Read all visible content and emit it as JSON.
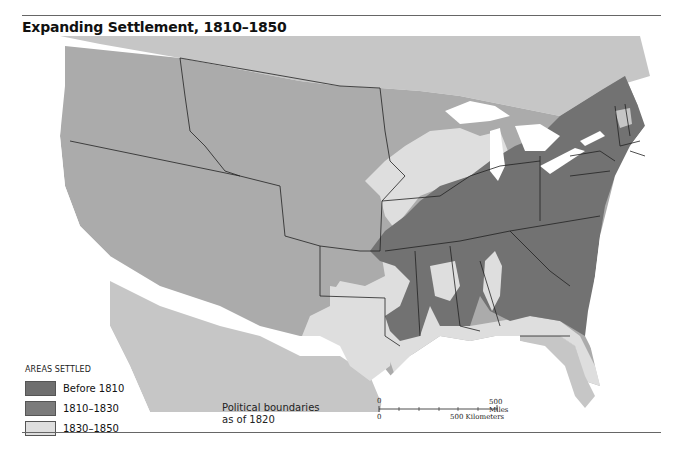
{
  "title": "Expanding Settlement, 1810–1850",
  "legend": {
    "heading": "AREAS SETTLED",
    "items": [
      {
        "label": "Before 1810",
        "color": "#6f6f6f"
      },
      {
        "label": "1810–1830",
        "color": "#7b7b7b"
      },
      {
        "label": "1830–1850",
        "color": "#dedede"
      }
    ]
  },
  "note": {
    "line1": "Political boundaries",
    "line2": "as of 1820"
  },
  "scale": {
    "miles_zero": "0",
    "miles_label": "500 Miles",
    "km_zero": "0",
    "km_label": "500 Kilometers"
  },
  "colors": {
    "water": "#ffffff",
    "unsettled": "#ababab",
    "foreign": "#c6c6c6",
    "before_1810": "#6f6f6f",
    "s1810_1830": "#7b7b7b",
    "s1830_1850": "#dedede",
    "boundary": "#222222"
  }
}
